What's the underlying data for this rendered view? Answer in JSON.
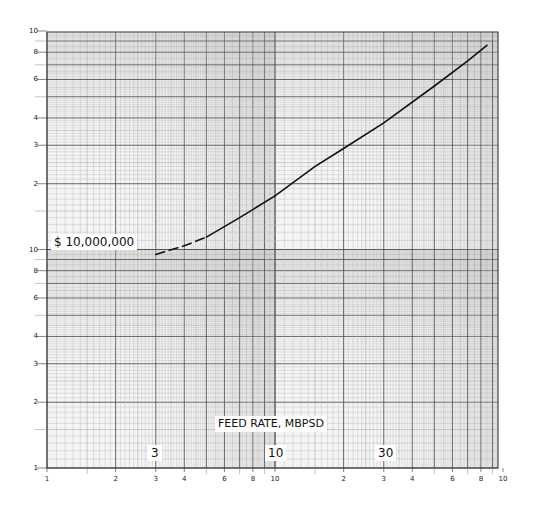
{
  "chart_data": {
    "type": "line",
    "title": "",
    "xlabel": "FEED RATE, MBPSD",
    "ylabel": "$ 10,000,000",
    "xscale": "log",
    "yscale": "log",
    "xlim": [
      1,
      100
    ],
    "ylim": [
      1,
      100
    ],
    "grid": true,
    "x_tick_labels": [
      "1",
      "2",
      "3",
      "4",
      "6",
      "8",
      "10",
      "2",
      "3",
      "4",
      "6",
      "8",
      "10"
    ],
    "y_tick_labels": [
      "1",
      "2",
      "3",
      "4",
      "6",
      "8",
      "10",
      "2",
      "3",
      "4",
      "6",
      "8",
      "10"
    ],
    "x_callouts": [
      "3",
      "10",
      "30"
    ],
    "reference_label": "$ 10,000,000",
    "series": [
      {
        "name": "Installed cost (dashed extrapolation)",
        "style": "dashed",
        "x": [
          3,
          4,
          5
        ],
        "y": [
          9.5,
          10.4,
          11.4
        ]
      },
      {
        "name": "Installed cost",
        "style": "solid",
        "x": [
          5,
          7,
          10,
          15,
          20,
          30,
          50,
          70,
          85
        ],
        "y": [
          11.4,
          14,
          17.6,
          24,
          29,
          38,
          56,
          73,
          86
        ]
      }
    ]
  },
  "labels": {
    "cost": "$ 10,000,000",
    "xaxis": "FEED RATE, MBPSD",
    "x3": "3",
    "x10": "10",
    "x30": "30"
  },
  "colors": {
    "grid_minor": "#b8b8b8",
    "grid_major": "#555555",
    "curve": "#111111"
  }
}
